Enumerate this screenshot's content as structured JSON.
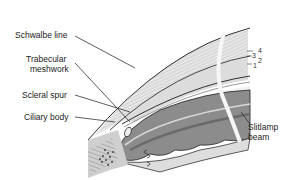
{
  "figure": {
    "labels": {
      "schwalbe_line": "Schwalbe line",
      "trabecular_meshwork_1": "Trabecular",
      "trabecular_meshwork_2": "meshwork",
      "scleral_spur": "Scleral spur",
      "ciliary_body": "Ciliary body",
      "slitlamp_beam_1": "Slitlamp",
      "slitlamp_beam_2": "beam"
    },
    "layer_numbers": [
      "4",
      "3",
      "2",
      "1"
    ],
    "colors": {
      "outline": "#333333",
      "cornea_fill": "#e4e4e4",
      "iris_fill": "#8a8a8a",
      "iris_dark": "#6d6d6d",
      "beam": "#f5f5f5",
      "text": "#222222"
    }
  }
}
